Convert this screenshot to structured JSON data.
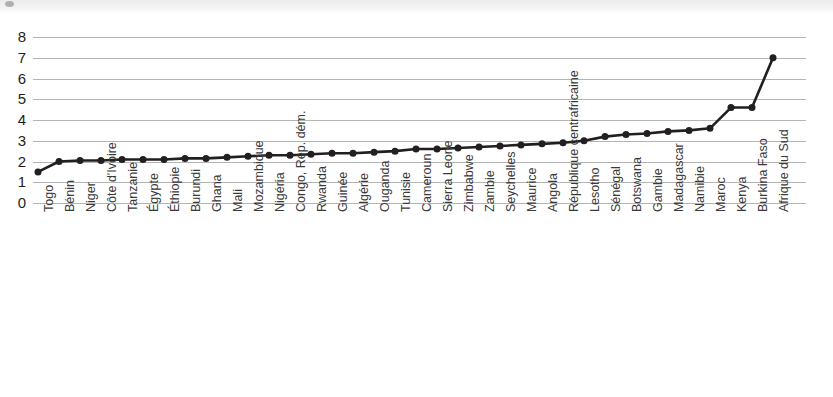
{
  "chart_data": {
    "type": "line",
    "title": "",
    "subtitle": "",
    "xlabel": "",
    "ylabel": "",
    "ylim": [
      0,
      8
    ],
    "yticks": [
      0,
      1,
      2,
      3,
      4,
      5,
      6,
      7,
      8
    ],
    "grid": true,
    "legend": "none",
    "marker": "circle",
    "line_color": "#231f20",
    "marker_color": "#231f20",
    "grid_color": "#b4b4b4",
    "categories": [
      "Togo",
      "Bénin",
      "Niger",
      "Côte d'Ivoire",
      "Tanzanie",
      "Égypte",
      "Éthiopie",
      "Burundi",
      "Ghana",
      "Mali",
      "Mozambique",
      "Nigéria",
      "Congo, Rép. dém.",
      "Rwanda",
      "Guinée",
      "Algérie",
      "Ouganda",
      "Tunisie",
      "Cameroun",
      "Sierra Leone",
      "Zimbabwe",
      "Zambie",
      "Seychelles",
      "Maurice",
      "Angola",
      "République centrafricaine",
      "Lesotho",
      "Sénégal",
      "Botswana",
      "Gambie",
      "Madagascar",
      "Namibie",
      "Maroc",
      "Kenya",
      "Burkina Faso",
      "Afrique du Sud"
    ],
    "values": [
      1.5,
      2.0,
      2.05,
      2.05,
      2.1,
      2.1,
      2.1,
      2.15,
      2.15,
      2.2,
      2.25,
      2.3,
      2.3,
      2.35,
      2.4,
      2.4,
      2.45,
      2.5,
      2.6,
      2.6,
      2.65,
      2.7,
      2.75,
      2.8,
      2.85,
      2.9,
      3.0,
      3.2,
      3.3,
      3.35,
      3.45,
      3.5,
      3.6,
      4.6,
      4.6,
      7.0
    ]
  }
}
